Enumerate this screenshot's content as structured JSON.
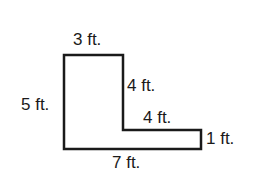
{
  "diagram": {
    "type": "L-shaped figure with dimension labels",
    "stroke_color": "#1a1a1a",
    "background": "#ffffff",
    "vertices": [
      [
        64,
        55
      ],
      [
        123,
        55
      ],
      [
        123,
        130
      ],
      [
        201,
        130
      ],
      [
        201,
        149
      ],
      [
        64,
        149
      ]
    ],
    "labels": {
      "top": "3 ft.",
      "left": "5 ft.",
      "inner_vertical": "4 ft.",
      "inner_horizontal": "4 ft.",
      "right": "1 ft.",
      "bottom": "7 ft."
    }
  }
}
